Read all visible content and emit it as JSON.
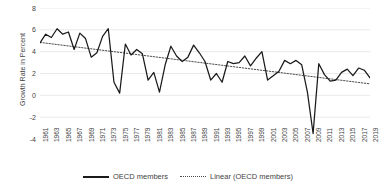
{
  "chart_data": {
    "type": "line",
    "title": "",
    "xlabel": "",
    "ylabel": "Growth Rate in Percent",
    "ylim": [
      -4,
      8
    ],
    "yticks": [
      8,
      6,
      4,
      2,
      0,
      -2,
      -4
    ],
    "grid": true,
    "legend_position": "bottom",
    "x": [
      1961,
      1962,
      1963,
      1964,
      1965,
      1966,
      1967,
      1968,
      1969,
      1970,
      1971,
      1972,
      1973,
      1974,
      1975,
      1976,
      1977,
      1978,
      1979,
      1980,
      1981,
      1982,
      1983,
      1984,
      1985,
      1986,
      1987,
      1988,
      1989,
      1990,
      1991,
      1992,
      1993,
      1994,
      1995,
      1996,
      1997,
      1998,
      1999,
      2000,
      2001,
      2002,
      2003,
      2004,
      2005,
      2006,
      2007,
      2008,
      2009,
      2010,
      2011,
      2012,
      2013,
      2014,
      2015,
      2016,
      2017,
      2018,
      2019
    ],
    "xtick_labels": [
      "1961",
      "1963",
      "1965",
      "1967",
      "1969",
      "1971",
      "1973",
      "1975",
      "1977",
      "1979",
      "1981",
      "1983",
      "1985",
      "1987",
      "1989",
      "1991",
      "1993",
      "1995",
      "1997",
      "1999",
      "2001",
      "2003",
      "2005",
      "2007",
      "2009",
      "2011",
      "2013",
      "2015",
      "2017",
      "2019"
    ],
    "series": [
      {
        "name": "OECD members",
        "style": "solid",
        "color": "#1a1a1a",
        "values": [
          4.8,
          5.6,
          5.3,
          6.1,
          5.6,
          5.8,
          4.2,
          5.7,
          5.2,
          3.5,
          3.9,
          5.4,
          6.1,
          1.2,
          0.2,
          4.7,
          3.7,
          4.2,
          3.8,
          1.4,
          2.1,
          0.3,
          2.8,
          4.5,
          3.6,
          3.1,
          3.5,
          4.6,
          3.9,
          3.1,
          1.4,
          2.0,
          1.2,
          3.1,
          2.9,
          3.0,
          3.6,
          2.7,
          3.4,
          4.0,
          1.4,
          1.8,
          2.2,
          3.2,
          2.9,
          3.2,
          2.8,
          0.3,
          -3.5,
          2.9,
          1.9,
          1.3,
          1.4,
          2.1,
          2.4,
          1.8,
          2.5,
          2.3,
          1.6
        ]
      },
      {
        "name": "Linear (OECD members)",
        "style": "dotted",
        "color": "#4a4a4a",
        "trendline": true,
        "start_value": 4.85,
        "end_value": 1.05
      }
    ],
    "legend": [
      {
        "label": "OECD members",
        "style": "solid"
      },
      {
        "label": "Linear (OECD members)",
        "style": "dotted"
      }
    ]
  },
  "colors": {
    "series_line": "#1a1a1a",
    "trend_line": "#4a4a4a",
    "grid": "#e3e3e3",
    "text": "#3f3f3f",
    "background": "#ffffff"
  }
}
